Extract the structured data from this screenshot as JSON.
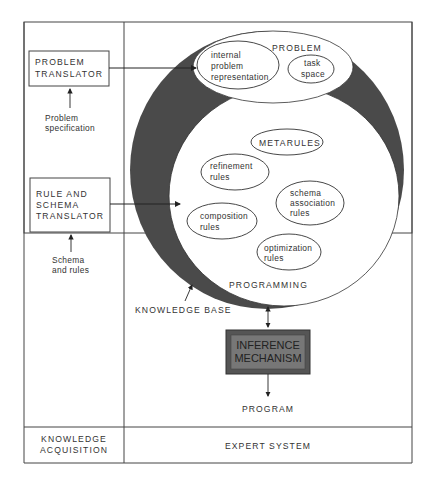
{
  "left_panel": {
    "problem_translator": {
      "line1": "PROBLEM",
      "line2": "TRANSLATOR"
    },
    "problem_spec": {
      "line1": "Problem",
      "line2": "specification"
    },
    "rule_schema_translator": {
      "line1": "RULE AND",
      "line2": "SCHEMA",
      "line3": "TRANSLATOR"
    },
    "schema_rules": {
      "line1": "Schema",
      "line2": "and rules"
    },
    "footer": {
      "line1": "KNOWLEDGE",
      "line2": "ACQUISITION"
    }
  },
  "right_panel": {
    "problem_region": {
      "title": "PROBLEM",
      "internal": {
        "line1": "internal",
        "line2": "problem",
        "line3": "representation"
      },
      "task_space": {
        "line1": "task",
        "line2": "space"
      }
    },
    "programming_region": {
      "title": "PROGRAMMING",
      "metarules": "METARULES",
      "refinement": {
        "line1": "refinement",
        "line2": "rules"
      },
      "schema_assoc": {
        "line1": "schema",
        "line2": "association",
        "line3": "rules"
      },
      "composition": {
        "line1": "composition",
        "line2": "rules"
      },
      "optimization": {
        "line1": "optimization",
        "line2": "rules"
      }
    },
    "knowledge_base_label": "KNOWLEDGE BASE",
    "inference": {
      "line1": "INFERENCE",
      "line2": "MECHANISM"
    },
    "program_label": "PROGRAM",
    "footer": "EXPERT SYSTEM"
  },
  "colors": {
    "ring": "#4a4a4a",
    "inference_box": "#555555",
    "line": "#333333"
  }
}
